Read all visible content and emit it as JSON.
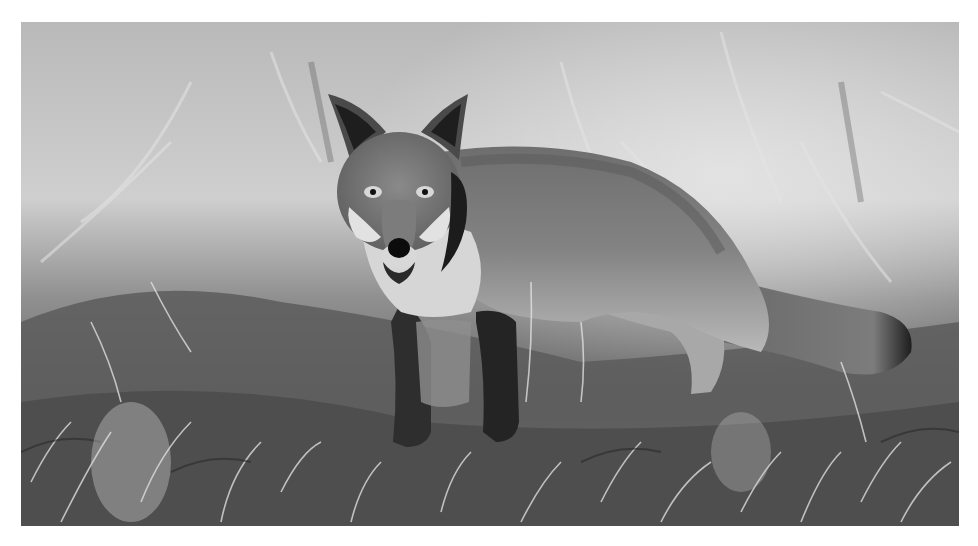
{
  "photo": {
    "subject": "Red fox standing in frosty grass, looking at the camera",
    "style": "grayscale photograph",
    "alt": "A fox standing in frost-covered grass, head turned toward the viewer",
    "palette": {
      "background_light": "#d8d8d8",
      "background_mid": "#a8a8a8",
      "grass_dark": "#3a3a3a",
      "fur_mid": "#7a7a7a",
      "fur_dark": "#2a2a2a",
      "fur_light": "#e6e6e6",
      "nose": "#0c0c0c"
    }
  },
  "caption": {
    "text": ""
  }
}
